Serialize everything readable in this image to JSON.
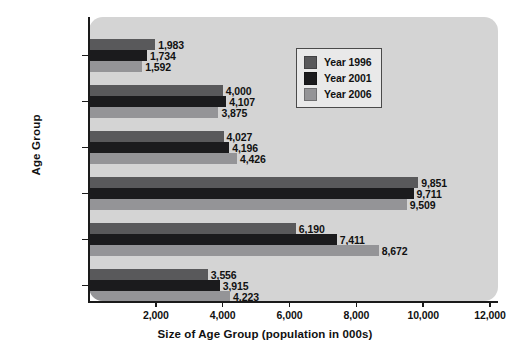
{
  "chart_data": {
    "type": "bar",
    "orientation": "horizontal",
    "title": "",
    "xlabel": "Size of Age Group (population in 000s)",
    "ylabel": "Age Group",
    "categories": [
      "0—4",
      "5—14",
      "15—24",
      "25—44",
      "45—64",
      "65+"
    ],
    "series": [
      {
        "name": "Year 1996",
        "color": "#59595b",
        "values": [
          1983,
          4000,
          4027,
          9851,
          6190,
          3556
        ],
        "labels": [
          "1,983",
          "4,000",
          "4,027",
          "9,851",
          "6,190",
          "3,556"
        ]
      },
      {
        "name": "Year 2001",
        "color": "#1b1b1d",
        "values": [
          1734,
          4107,
          4196,
          9711,
          7411,
          3915
        ],
        "labels": [
          "1,734",
          "4,107",
          "4,196",
          "9,711",
          "7,411",
          "3,915"
        ]
      },
      {
        "name": "Year 2006",
        "color": "#949497",
        "values": [
          1592,
          3875,
          4426,
          9509,
          8672,
          4223
        ],
        "labels": [
          "1,592",
          "3,875",
          "4,426",
          "9,509",
          "8,672",
          "4,223"
        ]
      }
    ],
    "xlim": [
      0,
      12000
    ],
    "xticks": [
      2000,
      4000,
      6000,
      8000,
      10000,
      12000
    ],
    "xtick_labels": [
      "2,000",
      "4,000",
      "6,000",
      "8,000",
      "10,000",
      "12,000"
    ],
    "grid": false,
    "legend_position": "upper-right",
    "legend_entries": [
      "Year 1996",
      "Year 2001",
      "Year 2006"
    ],
    "plot_background": "#d4d4d4",
    "page_background": "#ffffff"
  }
}
